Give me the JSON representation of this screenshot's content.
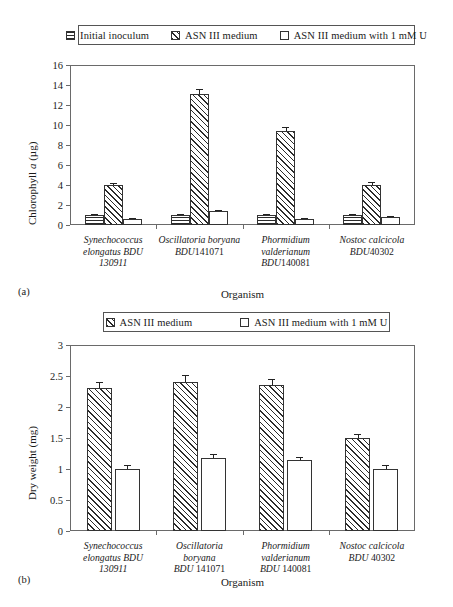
{
  "figure": {
    "panels": [
      {
        "letter": "(a)",
        "legend": [
          {
            "label": "Initial inoculum",
            "pattern": "hlines"
          },
          {
            "label": "ASN III medium",
            "pattern": "diag"
          },
          {
            "label": "ASN III medium with 1 mM U",
            "pattern": "dots"
          }
        ],
        "chart_data": {
          "type": "bar",
          "title": "",
          "xlabel": "Organism",
          "ylabel": "Chlorophyll a (µg)",
          "ylim": [
            0,
            16
          ],
          "yticks": [
            0,
            2,
            4,
            6,
            8,
            10,
            12,
            14,
            16
          ],
          "ytick_labels": [
            "0",
            "2",
            "4",
            "6",
            "8",
            "10",
            "12",
            "14",
            "16"
          ],
          "grid": false,
          "legend_position": "top",
          "categories": [
            [
              "Synechococcus",
              "elongatus BDU",
              "130911"
            ],
            [
              "Oscillatoria boryana",
              "BDU141071",
              ""
            ],
            [
              "Phormidium",
              "valderianum",
              "BDU140081"
            ],
            [
              "Nostoc calcicola",
              "BDU40302",
              ""
            ]
          ],
          "series": [
            {
              "name": "Initial inoculum",
              "pattern": "hlines",
              "values": [
                1.0,
                1.0,
                1.0,
                1.0
              ],
              "errors": [
                0.1,
                0.1,
                0.1,
                0.1
              ]
            },
            {
              "name": "ASN III medium",
              "pattern": "diag",
              "values": [
                4.0,
                13.1,
                9.4,
                4.0
              ],
              "errors": [
                0.25,
                0.55,
                0.45,
                0.3
              ]
            },
            {
              "name": "ASN III medium with 1 mM U",
              "pattern": "dots",
              "values": [
                0.6,
                1.4,
                0.6,
                0.85
              ],
              "errors": [
                0.08,
                0.12,
                0.08,
                0.1
              ]
            }
          ]
        }
      },
      {
        "letter": "(b)",
        "legend": [
          {
            "label": "ASN III medium",
            "pattern": "diag"
          },
          {
            "label": "ASN III medium with 1 mM U",
            "pattern": "dots"
          }
        ],
        "chart_data": {
          "type": "bar",
          "title": "",
          "xlabel": "Organism",
          "ylabel": "Dry weight (mg)",
          "ylim": [
            0,
            3
          ],
          "yticks": [
            0,
            0.5,
            1,
            1.5,
            2,
            2.5,
            3
          ],
          "ytick_labels": [
            "0",
            "0.5",
            "1",
            "1.5",
            "2",
            "2.5",
            "3"
          ],
          "grid": false,
          "legend_position": "top",
          "categories": [
            [
              "Synechococcus",
              "elongatus BDU",
              "130911"
            ],
            [
              "Oscillatoria",
              "boryana",
              "BDU 141071"
            ],
            [
              "Phormidium",
              "valderianum",
              "BDU 140081"
            ],
            [
              "Nostoc calcicola",
              "BDU 40302",
              ""
            ]
          ],
          "series": [
            {
              "name": "ASN III medium",
              "pattern": "diag",
              "values": [
                2.3,
                2.4,
                2.35,
                1.5
              ],
              "errors": [
                0.1,
                0.11,
                0.1,
                0.07
              ]
            },
            {
              "name": "ASN III medium with 1 mM U",
              "pattern": "dots",
              "values": [
                1.0,
                1.18,
                1.14,
                1.0
              ],
              "errors": [
                0.07,
                0.07,
                0.06,
                0.06
              ]
            }
          ]
        }
      }
    ]
  }
}
